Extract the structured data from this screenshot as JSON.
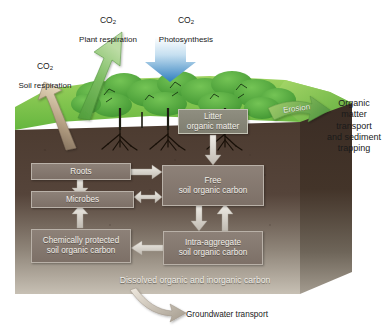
{
  "diagram": {
    "background": "#ffffff"
  },
  "flux_labels": {
    "plant_respiration": {
      "gas": "CO",
      "sub": "2",
      "name": "Plant respiration"
    },
    "photosynthesis": {
      "gas": "CO",
      "sub": "2",
      "name": "Photosynthesis"
    },
    "soil_respiration": {
      "gas": "CO",
      "sub": "2",
      "name": "Soil respiration"
    }
  },
  "erosion": {
    "label": "Erosion"
  },
  "transport": {
    "label": "Organic\nmatter\ntransport\nand sediment\ntrapping"
  },
  "groundwater": {
    "label": "Groundwater transport"
  },
  "pools": {
    "litter": "Litter\norganic matter",
    "roots": "Roots",
    "microbes": "Microbes",
    "free": "Free\nsoil organic carbon",
    "chemically_protected": "Chemically protected\nsoil organic carbon",
    "intra_aggregate": "Intra-aggregate\nsoil organic carbon",
    "dissolved": "Dissolved organic and inorganic carbon"
  },
  "colors": {
    "canopy_green": "#4fa83d",
    "grass_green": "#7cc24a",
    "arrow_green": "#7ec067",
    "photosynthesis_blue": "#3f8ec9",
    "soil_dark": "#4a3a30",
    "soil_light": "#b9b2a6",
    "box_fill": "#837769",
    "box_text": "#f2efe9",
    "arrow_grey": "#d7d3cc",
    "label_text": "#1a1a1a"
  }
}
